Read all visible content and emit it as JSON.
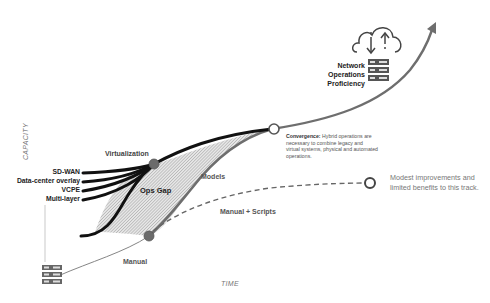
{
  "diagram": {
    "axes": {
      "y_label": "CAPACITY",
      "x_label": "TIME"
    },
    "main_curve": {
      "label": "Network Operations Proficiency",
      "lines": [
        "Network",
        "Operations",
        "Proficiency"
      ],
      "color": "#666666"
    },
    "nodes": {
      "virtualization": "Virtualization",
      "ops_gap": "Ops Gap",
      "models": "Models",
      "manual": "Manual",
      "manual_scripts": "Manual + Scripts"
    },
    "technologies": [
      "SD-WAN",
      "Data-center overlay",
      "VCPE",
      "Multi-layer"
    ],
    "convergence": {
      "title": "Convergence:",
      "text": "Hybrid operations are necessary to combine legacy and virtual systems, physical and automated operations."
    },
    "scripts_note": "Modest improvements and limited benefits to this track.",
    "icons": [
      "cloud-sync-icon",
      "server-rack-icon",
      "server-rack-small-icon"
    ],
    "colors": {
      "bold_line": "#111111",
      "accent_node": "#6b6b6b",
      "hatch": "#bdbdbd",
      "text_gray": "#777777"
    }
  }
}
